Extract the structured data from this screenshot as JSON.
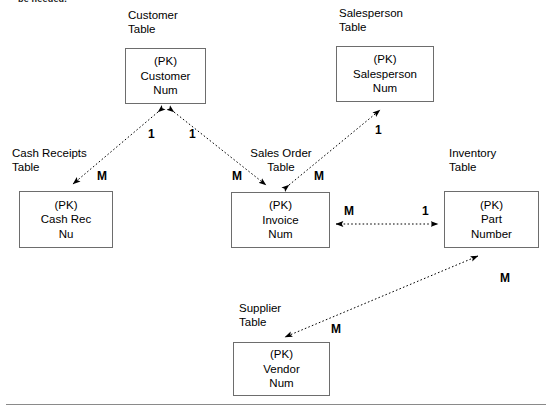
{
  "page": {
    "top_note": "be needed.",
    "background_color": "#ffffff",
    "line_color": "#000000",
    "box_border_color": "#6d6d6d",
    "rule_color": "#8a8a8a"
  },
  "diagram": {
    "type": "entity-relationship-diagram",
    "entities": [
      {
        "id": "customer",
        "caption": [
          "Customer",
          "Table"
        ],
        "lines": [
          "(PK)",
          "Customer",
          "Num"
        ],
        "box": {
          "x": 125,
          "y": 48,
          "w": 81,
          "h": 56
        },
        "caption_pos": {
          "x": 128,
          "y": 8
        }
      },
      {
        "id": "salesperson",
        "caption": [
          "Salesperson",
          "Table"
        ],
        "lines": [
          "(PK)",
          "Salesperson",
          "Num"
        ],
        "box": {
          "x": 336,
          "y": 46,
          "w": 98,
          "h": 56
        },
        "caption_pos": {
          "x": 339,
          "y": 6
        }
      },
      {
        "id": "cash-receipts",
        "caption": [
          "Cash Receipts",
          "Table"
        ],
        "lines": [
          "(PK)",
          "Cash Rec",
          "Nu"
        ],
        "box": {
          "x": 19,
          "y": 191,
          "w": 94,
          "h": 57
        },
        "caption_pos": {
          "x": 12,
          "y": 146
        }
      },
      {
        "id": "sales-order",
        "caption": [
          "Sales Order",
          "Table"
        ],
        "lines": [
          "(PK)",
          "Invoice",
          "Num"
        ],
        "box": {
          "x": 231,
          "y": 192,
          "w": 99,
          "h": 56
        },
        "caption_pos": {
          "x": 243,
          "y": 146
        }
      },
      {
        "id": "inventory",
        "caption": [
          "Inventory",
          "Table"
        ],
        "lines": [
          "(PK)",
          "Part",
          "Number"
        ],
        "box": {
          "x": 444,
          "y": 191,
          "w": 95,
          "h": 57
        },
        "caption_pos": {
          "x": 449,
          "y": 146
        }
      },
      {
        "id": "supplier",
        "caption": [
          "Supplier",
          "Table"
        ],
        "lines": [
          "(PK)",
          "Vendor",
          "Num"
        ],
        "box": {
          "x": 233,
          "y": 342,
          "w": 97,
          "h": 54
        },
        "caption_pos": {
          "x": 239,
          "y": 301
        }
      }
    ],
    "relationships": [
      {
        "id": "customer-cash-receipts",
        "from": "customer",
        "to": "cash-receipts",
        "style": "dotted",
        "arrows": "both",
        "labels": [
          {
            "text": "1",
            "x": 148,
            "y": 128
          },
          {
            "text": "M",
            "x": 97,
            "y": 170
          }
        ]
      },
      {
        "id": "customer-sales-order",
        "from": "customer",
        "to": "sales-order",
        "style": "dotted",
        "arrows": "both",
        "labels": [
          {
            "text": "1",
            "x": 189,
            "y": 128
          },
          {
            "text": "M",
            "x": 232,
            "y": 170
          }
        ]
      },
      {
        "id": "salesperson-sales-order",
        "from": "sales-order",
        "to": "salesperson",
        "style": "dotted",
        "arrows": "both",
        "labels": [
          {
            "text": "1",
            "x": 375,
            "y": 124
          },
          {
            "text": "M",
            "x": 314,
            "y": 170
          }
        ]
      },
      {
        "id": "sales-order-inventory",
        "from": "sales-order",
        "to": "inventory",
        "style": "dotted",
        "arrows": "both",
        "labels": [
          {
            "text": "M",
            "x": 344,
            "y": 205
          },
          {
            "text": "1",
            "x": 422,
            "y": 205
          }
        ]
      },
      {
        "id": "inventory-supplier",
        "from": "inventory",
        "to": "supplier",
        "style": "dotted",
        "arrows": "both",
        "labels": [
          {
            "text": "M",
            "x": 500,
            "y": 272
          },
          {
            "text": "M",
            "x": 331,
            "y": 323
          }
        ]
      }
    ]
  }
}
